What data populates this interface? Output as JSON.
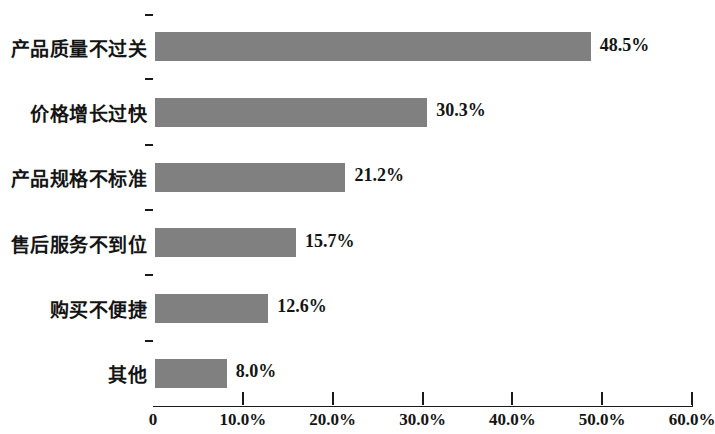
{
  "chart_data": {
    "type": "bar",
    "orientation": "horizontal",
    "title": "",
    "subtitle": "",
    "xlabel": "",
    "ylabel": "",
    "categories": [
      "产品质量不过关",
      "价格增长过快",
      "产品规格不标准",
      "售后服务不到位",
      "购买不便捷",
      "其他"
    ],
    "values": [
      48.5,
      30.3,
      21.2,
      15.7,
      12.6,
      8.0
    ],
    "value_labels": [
      "48.5%",
      "30.3%",
      "21.2%",
      "15.7%",
      "12.6%",
      "8.0%"
    ],
    "xlim": [
      0,
      60
    ],
    "x_tick_values": [
      0,
      10,
      20,
      30,
      40,
      50,
      60
    ],
    "x_tick_labels": [
      "0",
      "10.0%",
      "20.0%",
      "30.0%",
      "40.0%",
      "50.0%",
      "60.0%"
    ],
    "grid": false,
    "legend": null,
    "bar_color": "#808080",
    "axis_color": "#1a1a1a",
    "text_color": "#141414",
    "background_color": "#ffffff"
  }
}
